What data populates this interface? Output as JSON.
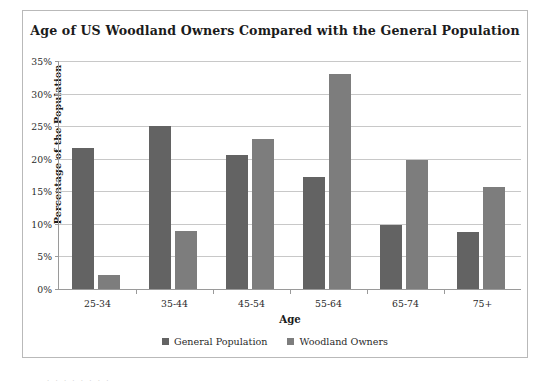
{
  "chart_data": {
    "type": "bar",
    "title": "Age of US Woodland Owners Compared with the General Population",
    "xlabel": "Age",
    "ylabel": "Percentage of the Population",
    "categories": [
      "25-34",
      "35-44",
      "45-54",
      "55-64",
      "65-74",
      "75+"
    ],
    "series": [
      {
        "name": "General Population",
        "color": "#636363",
        "values": [
          21.7,
          25.0,
          20.6,
          17.2,
          9.9,
          8.7
        ]
      },
      {
        "name": "Woodland Owners",
        "color": "#7d7d7d",
        "values": [
          2.1,
          8.9,
          23.0,
          33.0,
          19.8,
          15.6
        ]
      }
    ],
    "ylim": [
      0,
      35
    ],
    "ytick_values": [
      0,
      5,
      10,
      15,
      20,
      25,
      30,
      35
    ],
    "ytick_labels": [
      "0%",
      "5%",
      "10%",
      "15%",
      "20%",
      "25%",
      "30%",
      "35%"
    ],
    "grid": true,
    "legend_position": "bottom"
  },
  "figure": {
    "border_color": "#b9b9b9",
    "background": "#ffffff"
  },
  "bottom_artifact": "·  ·   ·       ·        ·      ·         ·      ·"
}
